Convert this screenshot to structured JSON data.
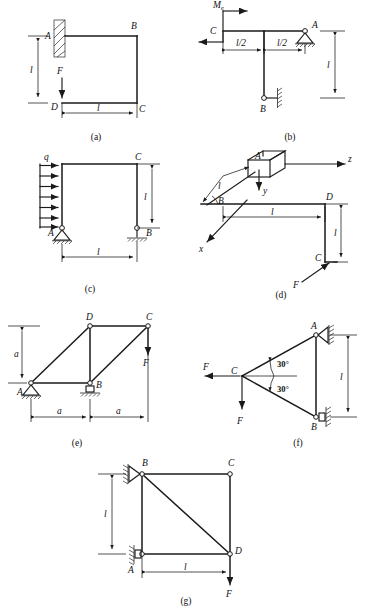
{
  "page": {
    "width": 370,
    "height": 614,
    "background": "#ffffff",
    "ink": "#1a1a1a",
    "caption": ""
  },
  "figures": [
    {
      "id": "a",
      "sub_label": "(a)",
      "description": "Cantilever bent frame fixed at A with vertical load F at D",
      "points": [
        "A",
        "B",
        "C",
        "D"
      ],
      "labels": {
        "A": "A",
        "B": "B",
        "C": "C",
        "D": "D",
        "force": "F",
        "dim_vertical": "l",
        "dim_horizontal": "l"
      },
      "supports": [
        {
          "at": "A",
          "type": "fixed-wall-hatched"
        }
      ],
      "loads": [
        {
          "at": "D",
          "symbol": "F",
          "direction": "down"
        }
      ]
    },
    {
      "id": "b",
      "sub_label": "(b)",
      "description": "Horizontal member with applied couple Me at C, pin support at A, link support at B",
      "points": [
        "A",
        "B",
        "C"
      ],
      "labels": {
        "A": "A",
        "B": "B",
        "C": "C",
        "moment": "M",
        "moment_sub": "e",
        "dim_left": "l/2",
        "dim_right": "l/2",
        "dim_vertical": "l"
      },
      "supports": [
        {
          "at": "A",
          "type": "pin-triangle-hatched"
        },
        {
          "at": "B",
          "type": "roller-link-wall"
        }
      ],
      "loads": [
        {
          "at": "C",
          "symbol": "Me",
          "direction": "couple"
        }
      ]
    },
    {
      "id": "c",
      "sub_label": "(c)",
      "description": "Portal frame with uniformly distributed load q on left column, pin at A, roller at B",
      "points": [
        "A",
        "B",
        "C"
      ],
      "labels": {
        "A": "A",
        "B": "B",
        "C": "C",
        "load": "q",
        "dim_vertical": "l",
        "dim_horizontal": "l"
      },
      "supports": [
        {
          "at": "A",
          "type": "pin-triangle-hatched"
        },
        {
          "at": "B",
          "type": "roller-hatched"
        }
      ],
      "loads": [
        {
          "symbol": "q",
          "type": "distributed",
          "arrows": 7,
          "direction": "right"
        }
      ]
    },
    {
      "id": "d",
      "sub_label": "(d)",
      "description": "Three dimensional bent bar with xyz axes, block at A, bend at B and D, force F at C",
      "points": [
        "A",
        "B",
        "C",
        "D"
      ],
      "labels": {
        "A": "A",
        "B": "B",
        "C": "C",
        "D": "D",
        "axis_x": "x",
        "axis_y": "y",
        "axis_z": "z",
        "dim_incline": "l",
        "dim_horizontal": "l",
        "dim_vertical": "l",
        "force": "F"
      },
      "loads": [
        {
          "at": "C",
          "symbol": "F",
          "direction": "oblique"
        }
      ]
    },
    {
      "id": "e",
      "sub_label": "(e)",
      "description": "Planar truss A-B-C-D, pin at A, roller at B, vertical load F at C",
      "points": [
        "A",
        "B",
        "C",
        "D"
      ],
      "labels": {
        "A": "A",
        "B": "B",
        "C": "C",
        "D": "D",
        "dim_vertical": "a",
        "dim_left": "a",
        "dim_right": "a",
        "force": "F"
      },
      "supports": [
        {
          "at": "A",
          "type": "pin-triangle-hatched"
        },
        {
          "at": "B",
          "type": "roller-hatched"
        }
      ],
      "loads": [
        {
          "at": "C",
          "symbol": "F",
          "direction": "down"
        }
      ]
    },
    {
      "id": "f",
      "sub_label": "(f)",
      "description": "Triangular frame with 30 degree angles at C, pin at A and roller at B on vertical wall, two forces F at C",
      "points": [
        "A",
        "B",
        "C"
      ],
      "labels": {
        "A": "A",
        "B": "B",
        "C": "C",
        "angle_upper": "30°",
        "angle_lower": "30°",
        "force_left": "F",
        "force_down": "F",
        "dim_vertical": "l"
      },
      "supports": [
        {
          "at": "A",
          "type": "pin-wall-hatched"
        },
        {
          "at": "B",
          "type": "roller-wall-hatched"
        }
      ],
      "loads": [
        {
          "at": "C",
          "symbol": "F",
          "direction": "left"
        },
        {
          "at": "C",
          "symbol": "F",
          "direction": "down"
        }
      ]
    },
    {
      "id": "g",
      "sub_label": "(g)",
      "description": "Square truss A-B-C-D with diagonal B-D, supports at A and B on vertical wall, load F at D",
      "points": [
        "A",
        "B",
        "C",
        "D"
      ],
      "labels": {
        "A": "A",
        "B": "B",
        "C": "C",
        "D": "D",
        "dim_vertical": "l",
        "dim_horizontal": "l",
        "force": "F"
      },
      "supports": [
        {
          "at": "B",
          "type": "pin-wall-hatched"
        },
        {
          "at": "A",
          "type": "roller-wall-hatched"
        }
      ],
      "loads": [
        {
          "at": "D",
          "symbol": "F",
          "direction": "down"
        }
      ]
    }
  ]
}
